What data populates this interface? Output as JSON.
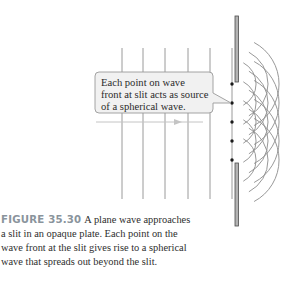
{
  "figure": {
    "label": "FIGURE 35.30",
    "caption_lines": [
      "A plane wave approaches",
      "a slit in an opaque plate. Each point on the",
      "wave front at the slit gives rise to a spherical",
      "wave that spreads out beyond the slit."
    ]
  },
  "callout": {
    "lines": [
      "Each point on wave",
      "front at slit acts as source",
      "of a spherical wave."
    ]
  },
  "diagram": {
    "plane_wavefront_x": [
      122,
      143,
      165,
      188,
      210,
      232
    ],
    "wavefront_y_range": [
      48,
      199
    ],
    "plate": {
      "x": 235,
      "width": 3.5,
      "upper_segment": [
        16,
        82
      ],
      "lower_segment": [
        163,
        226
      ]
    },
    "source_points_y": [
      84,
      103,
      122,
      141,
      160
    ],
    "wavelet_radii": [
      12,
      24,
      36,
      47
    ],
    "propagation_arrow": {
      "x1": 96,
      "x2": 203,
      "y": 122,
      "head_x": 182
    },
    "colors": {
      "wavefront": "#9a9a9a",
      "wavelet": "#8c8c8c",
      "plate_fill": "#b3b3b3",
      "plate_edge": "#4d4d4d",
      "source_dot": "#1a1a1a",
      "callout_fill": "#f1f1f1",
      "callout_stroke": "#9a9a9a",
      "arrow": "#c4c4c4",
      "figure_label": "#8a949c"
    }
  }
}
